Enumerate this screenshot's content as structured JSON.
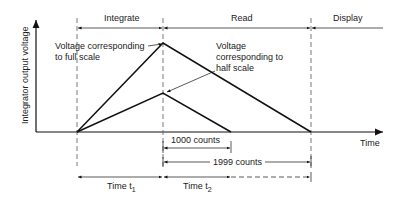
{
  "diagram": {
    "phases": [
      "Integrate",
      "Read",
      "Display"
    ],
    "y_axis_label": "Integrator output voltage",
    "x_axis_label": "Time",
    "annotations": {
      "full_scale": "Voltage corresponding to full scale",
      "full_scale_line1": "Voltage corresponding",
      "full_scale_line2": "to full scale",
      "half_scale_line1": "Voltage",
      "half_scale_line2": "corresponding to",
      "half_scale_line3": "half scale"
    },
    "counts": {
      "half": "1000 counts",
      "full": "1999 counts"
    },
    "times": {
      "t1": "Time t",
      "t1_sub": "1",
      "t2": "Time t",
      "t2_sub": "2"
    },
    "colors": {
      "line": "#111111",
      "text": "#222222",
      "background": "#ffffff"
    }
  }
}
